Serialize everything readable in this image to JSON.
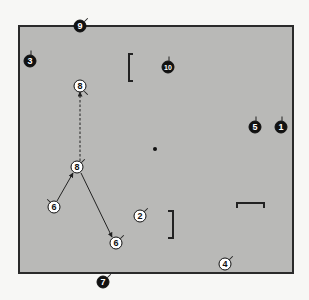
{
  "diagram": {
    "field": {
      "x": 18,
      "y": 25,
      "width": 274,
      "height": 247,
      "fill": "#b9b9b7",
      "border": "#2a2a2a"
    },
    "disc": {
      "x": 155,
      "y": 149
    },
    "players": [
      {
        "id": "p9",
        "label": "9",
        "team": "defense",
        "x": 80,
        "y": 26,
        "tick": "ne"
      },
      {
        "id": "p3",
        "label": "3",
        "team": "defense",
        "x": 30,
        "y": 61,
        "tick": "n"
      },
      {
        "id": "p10",
        "label": "10",
        "team": "defense",
        "x": 168,
        "y": 67,
        "tick": "n"
      },
      {
        "id": "p8a",
        "label": "8",
        "team": "offense",
        "x": 80,
        "y": 86,
        "tick": "se"
      },
      {
        "id": "p5",
        "label": "5",
        "team": "defense",
        "x": 255,
        "y": 127,
        "tick": "n"
      },
      {
        "id": "p1",
        "label": "1",
        "team": "defense",
        "x": 281,
        "y": 127,
        "tick": "n"
      },
      {
        "id": "p8b",
        "label": "8",
        "team": "offense",
        "x": 77,
        "y": 167,
        "tick": "ne"
      },
      {
        "id": "p6a",
        "label": "6",
        "team": "offense",
        "x": 54,
        "y": 207,
        "tick": "nw"
      },
      {
        "id": "p2",
        "label": "2",
        "team": "offense",
        "x": 140,
        "y": 216,
        "tick": "ne"
      },
      {
        "id": "p6b",
        "label": "6",
        "team": "offense",
        "x": 116,
        "y": 243,
        "tick": "ne"
      },
      {
        "id": "p4",
        "label": "4",
        "team": "offense",
        "x": 225,
        "y": 264,
        "tick": "ne"
      },
      {
        "id": "p7",
        "label": "7",
        "team": "defense",
        "x": 103,
        "y": 282,
        "tick": "ne"
      }
    ],
    "brackets": [
      {
        "id": "bracket-top-left",
        "orientation": "left",
        "x": 128,
        "y": 53,
        "width": 5,
        "height": 29
      },
      {
        "id": "bracket-mid-right",
        "orientation": "right",
        "x": 168,
        "y": 210,
        "width": 6,
        "height": 29
      },
      {
        "id": "bracket-right-top",
        "orientation": "top",
        "x": 236,
        "y": 202,
        "width": 29,
        "height": 6
      }
    ],
    "paths": [
      {
        "id": "cut-dashed",
        "style": "dashed",
        "from": [
          80,
          161
        ],
        "to": [
          80,
          92
        ],
        "arrow": true
      },
      {
        "id": "cut-6-to-8",
        "style": "solid",
        "from": [
          57,
          201
        ],
        "to": [
          73,
          173
        ],
        "arrow": true
      },
      {
        "id": "cut-8-to-6",
        "style": "solid",
        "from": [
          81,
          173
        ],
        "to": [
          112,
          237
        ],
        "arrow": true
      }
    ]
  }
}
